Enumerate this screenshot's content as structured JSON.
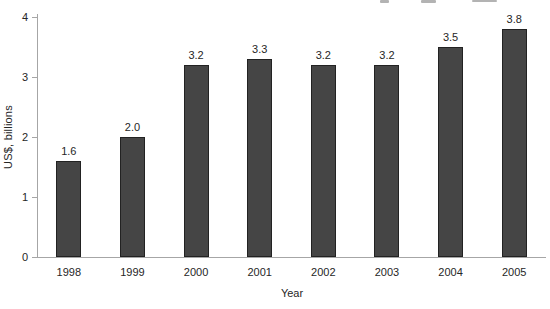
{
  "chart_data": {
    "type": "bar",
    "categories": [
      "1998",
      "1999",
      "2000",
      "2001",
      "2002",
      "2003",
      "2004",
      "2005"
    ],
    "values": [
      1.6,
      2.0,
      3.2,
      3.3,
      3.2,
      3.2,
      3.5,
      3.8
    ],
    "value_labels": [
      "1.6",
      "2.0",
      "3.2",
      "3.3",
      "3.2",
      "3.2",
      "3.5",
      "3.8"
    ],
    "title": "",
    "xlabel": "Year",
    "ylabel": "US$, billions",
    "ylim": [
      0,
      4
    ],
    "yticks": [
      0,
      1,
      2,
      3,
      4
    ],
    "grid": false,
    "legend_position": "none",
    "bar_color": "#454545",
    "bar_border_color": "#222222",
    "axis_color": "#a6a6a6",
    "text_color": "#262626"
  }
}
